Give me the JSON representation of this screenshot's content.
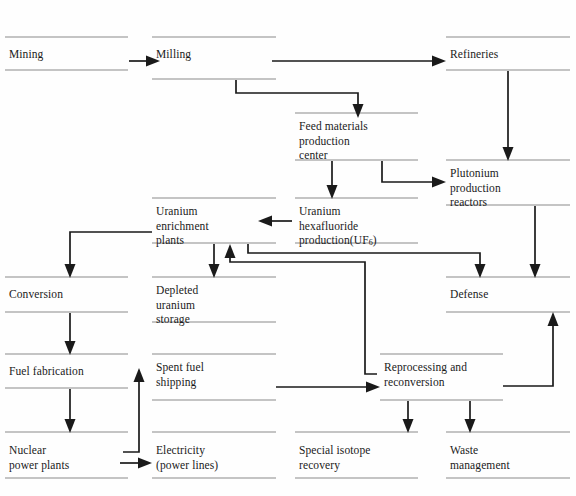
{
  "diagram": {
    "type": "flowchart",
    "line_color": "#1a1a1a",
    "rule_color": "#8a8a8a",
    "background": "#fefefe",
    "nodes": [
      {
        "id": "mining",
        "label": "Mining",
        "col": 1,
        "row": 1
      },
      {
        "id": "milling",
        "label": "Milling",
        "col": 2,
        "row": 1
      },
      {
        "id": "refineries",
        "label": "Refineries",
        "col": 4,
        "row": 1
      },
      {
        "id": "feed",
        "label": "Feed materials\nproduction\ncenter",
        "col": 3,
        "row": 2
      },
      {
        "id": "plutonium",
        "label": "Plutonium\nproduction\nreactors",
        "col": 4,
        "row": 3
      },
      {
        "id": "enrichment",
        "label": "Uranium\nenrichment\nplants",
        "col": 2,
        "row": 3
      },
      {
        "id": "hexafluoride",
        "label": "Uranium\nhexafluoride\nproduction(UF6)",
        "col": 3,
        "row": 3
      },
      {
        "id": "conversion",
        "label": "Conversion",
        "col": 1,
        "row": 4
      },
      {
        "id": "depleted",
        "label": "Depleted\nuranium\nstorage",
        "col": 2,
        "row": 4
      },
      {
        "id": "defense",
        "label": "Defense",
        "col": 4,
        "row": 4
      },
      {
        "id": "fuelfab",
        "label": "Fuel fabrication",
        "col": 1,
        "row": 5
      },
      {
        "id": "spentfuel",
        "label": "Spent fuel\nshipping",
        "col": 2,
        "row": 5
      },
      {
        "id": "reprocessing",
        "label": "Reprocessing and\nreconversion",
        "col": 3,
        "row": 5
      },
      {
        "id": "nuclear",
        "label": "Nuclear\npower plants",
        "col": 1,
        "row": 6
      },
      {
        "id": "electricity",
        "label": "Electricity\n(power lines)",
        "col": 2,
        "row": 6
      },
      {
        "id": "isotope",
        "label": "Special isotope\nrecovery",
        "col": 3,
        "row": 6
      },
      {
        "id": "waste",
        "label": "Waste\nmanagement",
        "col": 4,
        "row": 6
      }
    ],
    "labels": {
      "mining": "Mining",
      "milling": "Milling",
      "refineries": "Refineries",
      "feed": "Feed materials\nproduction\ncenter",
      "plutonium": "Plutonium\nproduction\nreactors",
      "enrichment": "Uranium\nenrichment\nplants",
      "hex_line1": "Uranium",
      "hex_line2": "hexafluoride",
      "hex_line3_pre": "production(UF",
      "hex_line3_sub": "6",
      "hex_line3_post": ")",
      "conversion": "Conversion",
      "depleted": "Depleted\nuranium\nstorage",
      "defense": "Defense",
      "fuelfab": "Fuel fabrication",
      "spentfuel": "Spent fuel\nshipping",
      "reprocessing": "Reprocessing and\nreconversion",
      "nuclear": "Nuclear\npower plants",
      "electricity": "Electricity\n(power lines)",
      "isotope": "Special isotope\nrecovery",
      "waste": "Waste\nmanagement"
    },
    "edges": [
      {
        "from": "mining",
        "to": "milling",
        "kind": "horizontal-arrow"
      },
      {
        "from": "milling",
        "to": "refineries",
        "kind": "horizontal-arrow"
      },
      {
        "from": "milling",
        "to": "feed",
        "kind": "elbow-down-right"
      },
      {
        "from": "refineries",
        "to": "plutonium",
        "kind": "vertical-arrow"
      },
      {
        "from": "feed",
        "to": "hexafluoride",
        "kind": "vertical-arrow"
      },
      {
        "from": "feed",
        "to": "plutonium",
        "kind": "elbow-down-right"
      },
      {
        "from": "hexafluoride",
        "to": "enrichment",
        "kind": "horizontal-arrow-left"
      },
      {
        "from": "hexafluoride",
        "to": "defense",
        "kind": "elbow-right-down"
      },
      {
        "from": "enrichment",
        "to": "conversion",
        "kind": "elbow-left-down"
      },
      {
        "from": "enrichment",
        "to": "depleted",
        "kind": "vertical-arrow"
      },
      {
        "from": "plutonium",
        "to": "defense",
        "kind": "vertical-arrow"
      },
      {
        "from": "conversion",
        "to": "fuelfab",
        "kind": "vertical-arrow"
      },
      {
        "from": "fuelfab",
        "to": "nuclear",
        "kind": "vertical-arrow"
      },
      {
        "from": "nuclear",
        "to": "electricity",
        "kind": "horizontal-arrow"
      },
      {
        "from": "nuclear",
        "to": "spentfuel",
        "kind": "elbow-right-up"
      },
      {
        "from": "spentfuel",
        "to": "reprocessing",
        "kind": "horizontal-arrow"
      },
      {
        "from": "reprocessing",
        "to": "enrichment",
        "kind": "elbow-up-left-up"
      },
      {
        "from": "reprocessing",
        "to": "defense",
        "kind": "elbow-right-up"
      },
      {
        "from": "reprocessing",
        "to": "isotope",
        "kind": "vertical-arrow"
      },
      {
        "from": "reprocessing",
        "to": "waste",
        "kind": "vertical-arrow"
      }
    ]
  }
}
